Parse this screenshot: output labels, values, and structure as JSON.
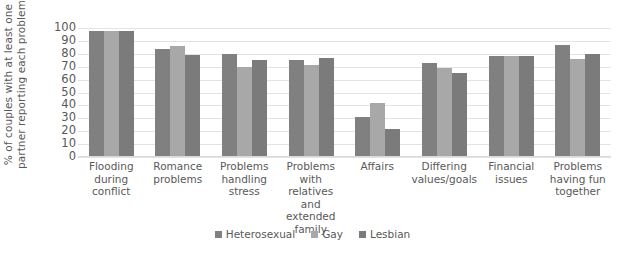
{
  "chart_data": {
    "type": "bar",
    "title": "",
    "subtitle": "",
    "xlabel": "",
    "ylabel_lines": [
      "% of couples with at least one",
      "partner reporting each problem"
    ],
    "ylabel": "% of couples with at least one partner reporting each problem",
    "ylim": [
      0,
      100
    ],
    "ytick_step": 10,
    "yticks": [
      "100",
      "90",
      "80",
      "70",
      "60",
      "50",
      "40",
      "30",
      "20",
      "10",
      "0"
    ],
    "grid": true,
    "grid_axis": "y",
    "legend_position": "bottom-center",
    "categories": [
      "Flooding during conflict",
      "Romance problems",
      "Problems handling stress",
      "Problems with relatives and extended family",
      "Affairs",
      "Differing values/goals",
      "Financial issues",
      "Problems having fun together"
    ],
    "category_label_lines": [
      [
        "Flooding",
        "during",
        "conflict"
      ],
      [
        "Romance",
        "problems"
      ],
      [
        "Problems",
        "handling",
        "stress"
      ],
      [
        "Problems with",
        "relatives and",
        "extended",
        "family"
      ],
      [
        "Affairs"
      ],
      [
        "Differing",
        "values/goals"
      ],
      [
        "Financial",
        "issues"
      ],
      [
        "Problems",
        "having fun",
        "together"
      ]
    ],
    "series": [
      {
        "name": "Heterosexual",
        "color": "#808080",
        "values": [
          98,
          84,
          80,
          75,
          31,
          73,
          78,
          87
        ]
      },
      {
        "name": "Gay",
        "color": "#a8a8a8",
        "values": [
          98,
          86,
          70,
          71,
          42,
          69,
          78,
          76
        ]
      },
      {
        "name": "Lesbian",
        "color": "#7b7b7b",
        "values": [
          98,
          79,
          75,
          77,
          22,
          65,
          78,
          80
        ]
      }
    ]
  },
  "colors": {
    "background": "#ffffff",
    "text": "#595959",
    "gridline": "#e3e3e3",
    "axis": "#d9d9d9"
  }
}
